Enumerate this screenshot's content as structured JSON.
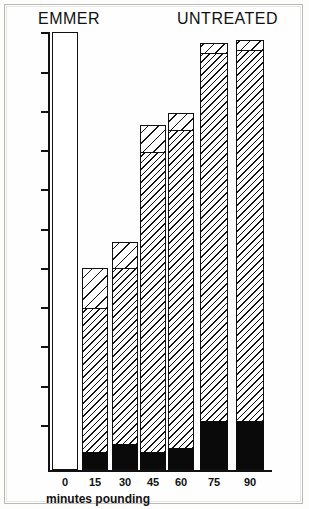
{
  "figure": {
    "title_left": "EMMER",
    "title_right": "UNTREATED"
  },
  "axis": {
    "x_title": "minutes pounding",
    "x_tick_labels": [
      "0",
      "15",
      "30",
      "45",
      "60",
      "75",
      "90"
    ],
    "y_tick_count": 11,
    "y_tick_labels": [
      "",
      "",
      "",
      "",
      "",
      "",
      "",
      "",
      "",
      "",
      ""
    ]
  },
  "colors": {
    "ink": "#111111",
    "paper": "#fefefe",
    "black_segment": "#0a0a0a",
    "hatch": "#111111",
    "hatch_background": "#ffffff"
  },
  "chart_data": {
    "type": "bar",
    "title": "EMMER UNTREATED",
    "subtitle": "",
    "xlabel": "minutes pounding",
    "ylabel": "",
    "categories": [
      "0",
      "15",
      "30",
      "45",
      "60",
      "75",
      "90"
    ],
    "stacked": true,
    "grid": false,
    "legend_position": "none",
    "ylim": [
      0,
      100
    ],
    "series": [
      {
        "name": "black-segment",
        "pattern": "solid-black",
        "values": [
          0,
          4,
          6,
          4,
          5,
          11,
          11
        ]
      },
      {
        "name": "dense-hatch-segment",
        "pattern": "dense-diagonal-hatch",
        "values": [
          0,
          33,
          42,
          68,
          74,
          84,
          85
        ]
      },
      {
        "name": "light-hatch-segment",
        "pattern": "sparse-diagonal-hatch",
        "values": [
          0,
          9,
          6,
          6,
          4,
          2,
          2
        ]
      }
    ],
    "totals": [
      0,
      46,
      54,
      78,
      83,
      97,
      98
    ],
    "annotations": [
      {
        "text": "EMMER",
        "position": "top-left"
      },
      {
        "text": "UNTREATED",
        "position": "top-right"
      }
    ]
  },
  "bars": [
    {
      "label": "0",
      "x": 4,
      "width": 26,
      "black_h": 0,
      "dense_h": 0,
      "light_h": 0,
      "empty_h": 438
    },
    {
      "label": "15",
      "x": 34,
      "width": 26,
      "black_h": 18,
      "dense_h": 144,
      "light_h": 40,
      "empty_h": 0
    },
    {
      "label": "30",
      "x": 64,
      "width": 26,
      "black_h": 26,
      "dense_h": 176,
      "light_h": 26,
      "empty_h": 0
    },
    {
      "label": "45",
      "x": 92,
      "width": 26,
      "black_h": 18,
      "dense_h": 300,
      "light_h": 27,
      "empty_h": 0
    },
    {
      "label": "60",
      "x": 120,
      "width": 26,
      "black_h": 22,
      "dense_h": 318,
      "light_h": 17,
      "empty_h": 0
    },
    {
      "label": "75",
      "x": 152,
      "width": 28,
      "black_h": 49,
      "dense_h": 368,
      "light_h": 10,
      "empty_h": 0
    },
    {
      "label": "90",
      "x": 188,
      "width": 28,
      "black_h": 49,
      "dense_h": 371,
      "light_h": 10,
      "empty_h": 0
    }
  ],
  "y_ticks": [
    0,
    40,
    79,
    118,
    157,
    197,
    236,
    275,
    314,
    354,
    393
  ]
}
